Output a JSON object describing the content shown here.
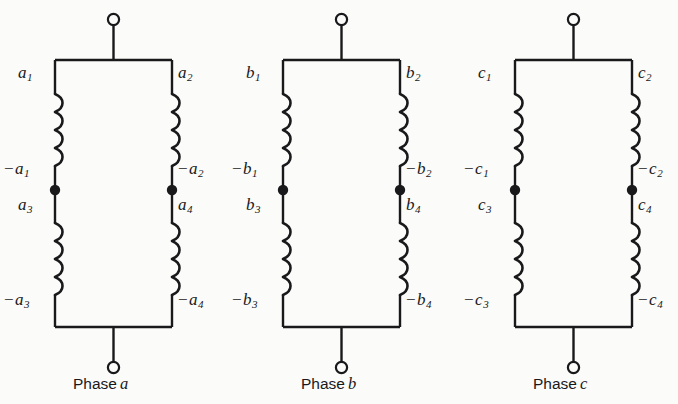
{
  "figure": {
    "type": "electrical-schematic",
    "background_color": "#fbfbf9",
    "line_color": "#19191b",
    "phases": [
      {
        "id": "phase-a",
        "caption_prefix": "Phase",
        "caption_letter": "a",
        "labels": {
          "top_left": "a",
          "top_left_sub": "1",
          "top_right": "a",
          "top_right_sub": "2",
          "mid_left_neg": "−",
          "mid_left": "a",
          "mid_left_sub": "1",
          "mid_right_neg": "−",
          "mid_right": "a",
          "mid_right_sub": "2",
          "lower_left": "a",
          "lower_left_sub": "3",
          "lower_right": "a",
          "lower_right_sub": "4",
          "bottom_left_neg": "−",
          "bottom_left": "a",
          "bottom_left_sub": "3",
          "bottom_right_neg": "−",
          "bottom_right": "a",
          "bottom_right_sub": "4"
        }
      },
      {
        "id": "phase-b",
        "caption_prefix": "Phase",
        "caption_letter": "b",
        "labels": {
          "top_left": "b",
          "top_left_sub": "1",
          "top_right": "b",
          "top_right_sub": "2",
          "mid_left_neg": "−",
          "mid_left": "b",
          "mid_left_sub": "1",
          "mid_right_neg": "−",
          "mid_right": "b",
          "mid_right_sub": "2",
          "lower_left": "b",
          "lower_left_sub": "3",
          "lower_right": "b",
          "lower_right_sub": "4",
          "bottom_left_neg": "−",
          "bottom_left": "b",
          "bottom_left_sub": "3",
          "bottom_right_neg": "−",
          "bottom_right": "b",
          "bottom_right_sub": "4"
        }
      },
      {
        "id": "phase-c",
        "caption_prefix": "Phase",
        "caption_letter": "c",
        "labels": {
          "top_left": "c",
          "top_left_sub": "1",
          "top_right": "c",
          "top_right_sub": "2",
          "mid_left_neg": "−",
          "mid_left": "c",
          "mid_left_sub": "1",
          "mid_right_neg": "−",
          "mid_right": "c",
          "mid_right_sub": "2",
          "lower_left": "c",
          "lower_left_sub": "3",
          "lower_right": "c",
          "lower_right_sub": "4",
          "bottom_left_neg": "−",
          "bottom_left": "c",
          "bottom_left_sub": "3",
          "bottom_right_neg": "−",
          "bottom_right": "c",
          "bottom_right_sub": "4"
        }
      }
    ]
  }
}
